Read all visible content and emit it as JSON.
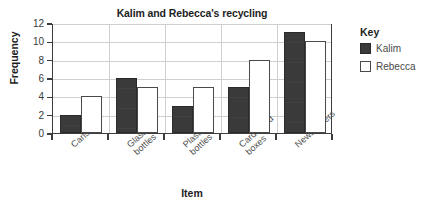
{
  "chart_data": {
    "type": "bar",
    "title": "Kalim and Rebecca's recycling",
    "xlabel": "Item",
    "ylabel": "Frequency",
    "categories": [
      "Cans",
      "Glass\nbottles",
      "Plastic\nbottles",
      "Cardboard\nboxes",
      "Newspapers"
    ],
    "series": [
      {
        "name": "Kalim",
        "values": [
          2,
          6,
          3,
          5,
          11
        ],
        "color": "#3a3a3a"
      },
      {
        "name": "Rebecca",
        "values": [
          4,
          5,
          5,
          8,
          10
        ],
        "color": "#ffffff"
      }
    ],
    "ylim": [
      0,
      12
    ],
    "yticks": [
      0,
      2,
      4,
      6,
      8,
      10,
      12
    ],
    "grid": true,
    "legend_position": "right"
  },
  "legend": {
    "title": "Key",
    "entries": [
      {
        "label": "Kalim",
        "swatch": "filled-dark-square-icon"
      },
      {
        "label": "Rebecca",
        "swatch": "outlined-white-square-icon"
      }
    ]
  },
  "axis": {
    "y_tick_labels": [
      "12",
      "10",
      "8",
      "6",
      "4",
      "2",
      "0"
    ]
  }
}
